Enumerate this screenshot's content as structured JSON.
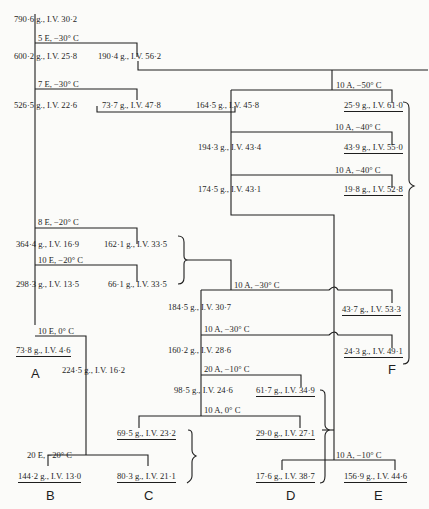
{
  "diagram": {
    "header": "",
    "nodes": [
      {
        "id": "n790",
        "text": "790·6 g., I.V. 30·2"
      },
      {
        "id": "s1",
        "text": "5 E, −30° C"
      },
      {
        "id": "n600",
        "text": "600·2 g., I.V. 25·8"
      },
      {
        "id": "n190",
        "text": "190·4 g., I.V. 56·2"
      },
      {
        "id": "s2",
        "text": "7 E, −30° C"
      },
      {
        "id": "n526",
        "text": "526·5 g., I.V. 22·6"
      },
      {
        "id": "n73_7",
        "text": "73·7 g., I.V. 47·8"
      },
      {
        "id": "s3",
        "text": "10 A, −50° C"
      },
      {
        "id": "n164",
        "text": "164·5 g., I.V. 45·8"
      },
      {
        "id": "n25_9",
        "text": "25·9 g., I.V. 61·0"
      },
      {
        "id": "s4",
        "text": "10 A, −40° C"
      },
      {
        "id": "n194",
        "text": "194·3 g., I.V. 43·4"
      },
      {
        "id": "n43_9",
        "text": "43·9 g., I.V. 55·0"
      },
      {
        "id": "s5",
        "text": "10 A, −40° C"
      },
      {
        "id": "n174",
        "text": "174·5 g., I.V. 43·1"
      },
      {
        "id": "n19_8",
        "text": "19·8 g., I.V. 52·8"
      },
      {
        "id": "s6",
        "text": "8 E, −20° C"
      },
      {
        "id": "n364",
        "text": "364·4 g., I.V. 16·9"
      },
      {
        "id": "n162",
        "text": "162·1 g., I.V. 33·5"
      },
      {
        "id": "s7",
        "text": "10 E, −20° C"
      },
      {
        "id": "n298",
        "text": "298·3 g., I.V. 13·5"
      },
      {
        "id": "n66",
        "text": "66·1 g., I.V. 33·5"
      },
      {
        "id": "s8",
        "text": "10 A, −30° C"
      },
      {
        "id": "n184",
        "text": "184·5 g., I.V. 30·7"
      },
      {
        "id": "n43_7",
        "text": "43·7 g., I.V. 53·3"
      },
      {
        "id": "s9",
        "text": "10 A, −30° C"
      },
      {
        "id": "n160",
        "text": "160·2 g., I.V. 28·6"
      },
      {
        "id": "n24_3",
        "text": "24·3 g., I.V. 49·1"
      },
      {
        "id": "s10",
        "text": "10 E, 0° C"
      },
      {
        "id": "n73_8",
        "text": "73·8 g., I.V. 4·6"
      },
      {
        "id": "n224",
        "text": "224·5 g., I.V. 16·2"
      },
      {
        "id": "s11",
        "text": "20 A, −10° C"
      },
      {
        "id": "n98",
        "text": "98·5 g., I.V. 24·6"
      },
      {
        "id": "n61_7",
        "text": "61·7 g., I.V. 34·9"
      },
      {
        "id": "s12",
        "text": "10 A, 0° C"
      },
      {
        "id": "n69_5",
        "text": "69·5 g., I.V. 23·2"
      },
      {
        "id": "n29_0",
        "text": "29·0 g., I.V. 27·1"
      },
      {
        "id": "s13",
        "text": "20 E, −20° C"
      },
      {
        "id": "s14",
        "text": "10 A, −10° C"
      },
      {
        "id": "n144",
        "text": "144·2 g., I.V. 13·0"
      },
      {
        "id": "n80_3",
        "text": "80·3 g., I.V. 21·1"
      },
      {
        "id": "n17_6",
        "text": "17·6 g., I.V. 38·7"
      },
      {
        "id": "n156",
        "text": "156·9 g., I.V. 44·6"
      }
    ],
    "fractions": {
      "A": "A",
      "B": "B",
      "C": "C",
      "D": "D",
      "E": "E",
      "F": "F"
    },
    "legend": {
      "E": "E = acetone solvent",
      "A": "A = acetone crystallization"
    }
  }
}
